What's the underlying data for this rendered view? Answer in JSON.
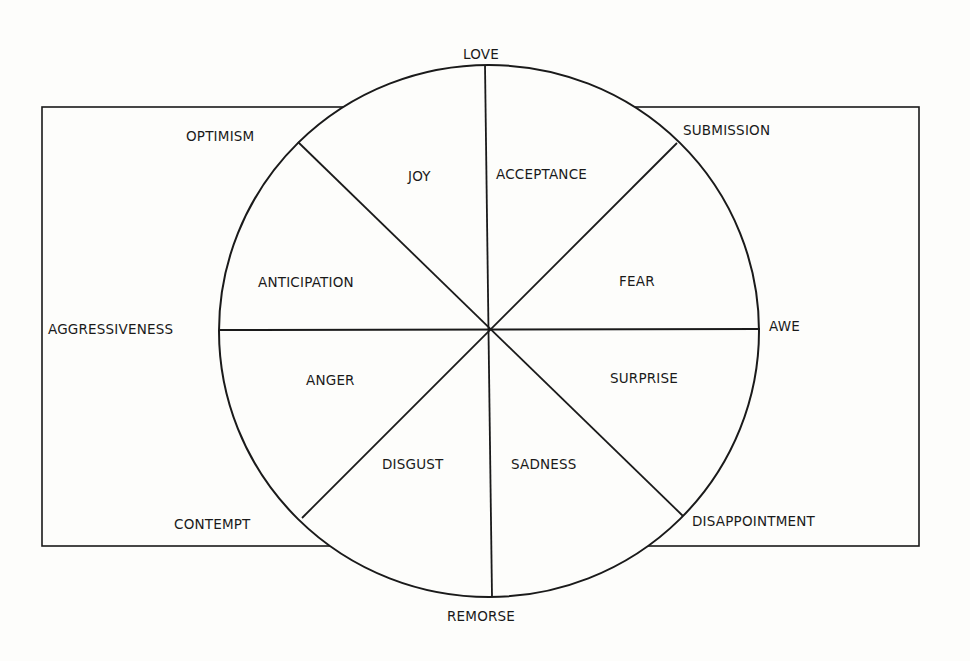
{
  "diagram": {
    "type": "wheel-of-emotions",
    "colors": {
      "background": "#fdfdfb",
      "ink": "#1a1a1a"
    },
    "poles": {
      "top": "LOVE",
      "bottom": "REMORSE",
      "left": "AGGRESSIVENESS",
      "right": "AWE",
      "upper_left": "OPTIMISM",
      "upper_right": "SUBMISSION",
      "lower_left": "CONTEMPT",
      "lower_right": "DISAPPOINTMENT"
    },
    "sectors": {
      "joy": "JOY",
      "acceptance": "ACCEPTANCE",
      "fear": "FEAR",
      "surprise": "SURPRISE",
      "sadness": "SADNESS",
      "disgust": "DISGUST",
      "anger": "ANGER",
      "anticipation": "ANTICIPATION"
    }
  }
}
